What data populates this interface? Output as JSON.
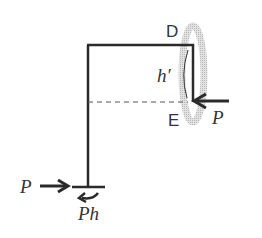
{
  "diagram": {
    "type": "portal-frame free body diagram",
    "labels": {
      "top_joint": "D",
      "lower_joint": "E",
      "height": "h′",
      "load_right": "P",
      "reaction_horizontal": "P",
      "reaction_moment": "Ph"
    },
    "colors": {
      "line": "#2a2a2a",
      "highlight": "#c8c8c8",
      "text": "#333333"
    }
  }
}
